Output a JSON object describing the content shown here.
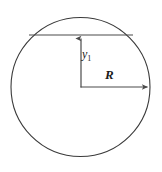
{
  "figure": {
    "background_color": "#ffffff",
    "stroke_color": "#3a3a3a",
    "line_color": "#4a4a4a",
    "text_color": "#1b1b1b",
    "width": 162,
    "height": 172
  },
  "shapes": {
    "circle": {
      "name": "circle-outline",
      "center_x": 80.5,
      "center_y": 87,
      "radius": 69.5,
      "stroke_width": 1.1
    },
    "chord": {
      "name": "horizontal-chord",
      "x1": 29,
      "y1": 35,
      "x2": 133,
      "y2": 35,
      "stroke_width": 1.1
    },
    "center_point": {
      "x": 81,
      "y": 87
    }
  },
  "arrows": {
    "vertical": {
      "name": "y1-dimension-arrow",
      "from_x": 81,
      "from_y": 87,
      "to_x": 81,
      "to_y": 36,
      "direction": "up",
      "stroke_width": 1.2
    },
    "horizontal": {
      "name": "radius-dimension-arrow",
      "from_x": 81,
      "from_y": 87,
      "to_x": 150,
      "to_y": 87,
      "direction": "right",
      "stroke_width": 1.2
    }
  },
  "labels": {
    "y1": {
      "base": "y",
      "subscript": "1",
      "full": "y1",
      "x": 82,
      "y": 58
    },
    "radius": {
      "text": "R",
      "x": 105,
      "y": 79
    }
  }
}
